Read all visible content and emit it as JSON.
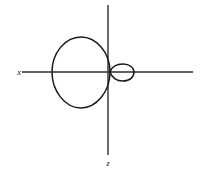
{
  "figure": {
    "background_color": "#ffffff",
    "stroke_color": "#1a1a1a",
    "axis_color": "#2b2b2b",
    "width": 203,
    "height": 173
  },
  "axes": {
    "horizontal": {
      "label": "x",
      "label_x": 19,
      "label_y": 75,
      "x1": 22,
      "y1": 72,
      "x2": 193,
      "y2": 72
    },
    "vertical": {
      "label": "z",
      "label_x": 108,
      "label_y": 166,
      "x1": 108,
      "y1": 5,
      "x2": 108,
      "y2": 155
    },
    "origin": {
      "x": 108,
      "y": 72
    }
  },
  "chart_data": {
    "type": "line",
    "title": "",
    "xlabel": "x",
    "ylabel": "z",
    "curve_name": "limacon-with-inner-loop",
    "grid": false,
    "legend": null,
    "annotations": [],
    "geometry": {
      "outer_loop": {
        "left_x": 52,
        "right_x": 110,
        "top_y": 37,
        "bottom_y": 108,
        "center_x": 81,
        "center_y": 72.5,
        "radius_x": 29,
        "radius_y": 35.5
      },
      "inner_loop": {
        "left_x": 110,
        "right_x": 134,
        "top_y": 64,
        "bottom_y": 81,
        "center_x": 122,
        "center_y": 72.5,
        "radius_x": 12,
        "radius_y": 8.5
      },
      "node_point": {
        "x": 110,
        "y": 72
      }
    },
    "path_outer": "M 110,72 C 110,52 96,37 81,37 C 65,37 52,53 52,72 C 52,91 65,108 81,108 C 96,108 110,92 110,72 Z",
    "path_inner": "M 110,72 C 112,66 117,64 123,64 C 130,64 134,68 134,72 C 134,77 130,81 123,81 C 117,81 112,78 110,72 Z"
  },
  "labels": {
    "x_axis_label": "x",
    "z_axis_label": "z"
  }
}
